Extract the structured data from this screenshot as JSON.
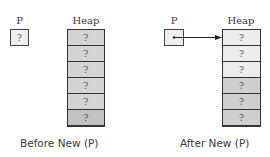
{
  "before": {
    "pointer": {
      "label": "P",
      "value": "?"
    },
    "heap": {
      "label": "Heap",
      "cells": [
        {
          "value": "?",
          "color": "#d4d4d4"
        },
        {
          "value": "?",
          "color": "#d4d4d4"
        },
        {
          "value": "?",
          "color": "#d4d4d4"
        },
        {
          "value": "?",
          "color": "#d4d4d4"
        },
        {
          "value": "?",
          "color": "#d4d4d4"
        },
        {
          "value": "?",
          "color": "#c2c2c2"
        }
      ]
    },
    "caption": "Before New (P)"
  },
  "after": {
    "pointer": {
      "label": "P",
      "value": "•",
      "points_to": "heap.cells.0"
    },
    "heap": {
      "label": "Heap",
      "cells": [
        {
          "value": "?",
          "color": "#ececec"
        },
        {
          "value": "?",
          "color": "#ececec"
        },
        {
          "value": "?",
          "color": "#ececec"
        },
        {
          "value": "?",
          "color": "#cfcfcf"
        },
        {
          "value": "?",
          "color": "#cfcfcf"
        },
        {
          "value": "?",
          "color": "#cfcfcf"
        }
      ]
    },
    "caption": "After New (P)"
  }
}
